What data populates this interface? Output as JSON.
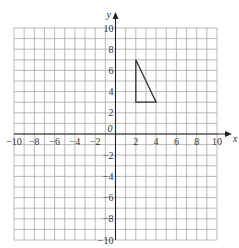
{
  "figure": {
    "grid": {
      "x_min": -10,
      "x_max": 10,
      "y_min": -10,
      "y_max": 10,
      "step": 1,
      "label_step": 2,
      "pixel_bounds": {
        "left": 14,
        "right": 217,
        "top": 28,
        "bottom": 240
      }
    },
    "axes": {
      "x_label": "x",
      "y_label": "y",
      "origin_label": "0",
      "x_tick_labels": [
        "−10",
        "−8",
        "−6",
        "−4",
        "−2",
        "2",
        "4",
        "6",
        "8",
        "10"
      ],
      "x_tick_values": [
        -10,
        -8,
        -6,
        -4,
        -2,
        2,
        4,
        6,
        8,
        10
      ],
      "y_tick_labels": [
        "10",
        "8",
        "6",
        "4",
        "2",
        "−2",
        "−4",
        "−6",
        "−8",
        "−10"
      ],
      "y_tick_values": [
        10,
        8,
        6,
        4,
        2,
        -2,
        -4,
        -6,
        -8,
        -10
      ]
    },
    "shapes": [
      {
        "name": "triangle",
        "type": "polygon",
        "vertices": [
          [
            2,
            7
          ],
          [
            2,
            3
          ],
          [
            4,
            3
          ]
        ]
      }
    ],
    "colors": {
      "grid": "#a8a8a8",
      "axes": "#222222",
      "shape": "#333333",
      "text": "#333333",
      "background": "#ffffff"
    }
  }
}
